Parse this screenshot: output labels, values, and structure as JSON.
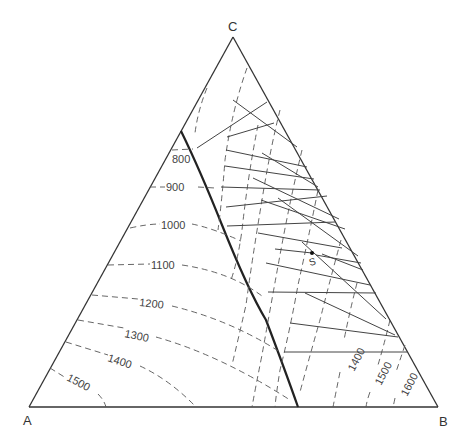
{
  "diagram": {
    "type": "ternary-phase-diagram",
    "vertices": {
      "A": {
        "label": "A",
        "x": 29,
        "y": 407
      },
      "B": {
        "label": "B",
        "x": 438,
        "y": 407
      },
      "C": {
        "label": "C",
        "x": 233,
        "y": 37
      }
    },
    "point_S": {
      "label": "S",
      "x": 312,
      "y": 253
    },
    "left_isotherms": [
      {
        "label": "800",
        "label_x": 184,
        "label_y": 161
      },
      {
        "label": "900",
        "label_x": 170,
        "label_y": 188
      },
      {
        "label": "1000",
        "label_x": 172,
        "label_y": 228
      },
      {
        "label": "1100",
        "label_x": 163,
        "label_y": 267
      },
      {
        "label": "1200",
        "label_x": 150,
        "label_y": 304
      },
      {
        "label": "1300",
        "label_x": 137,
        "label_y": 333
      },
      {
        "label": "1400",
        "label_x": 121,
        "label_y": 363
      },
      {
        "label": "1500",
        "label_x": 75,
        "label_y": 387
      }
    ],
    "right_isotherms": [
      {
        "label": "1400",
        "label_x": 360,
        "label_y": 365
      },
      {
        "label": "1500",
        "label_x": 380,
        "label_y": 375
      },
      {
        "label": "1600",
        "label_x": 407,
        "label_y": 386
      }
    ]
  }
}
